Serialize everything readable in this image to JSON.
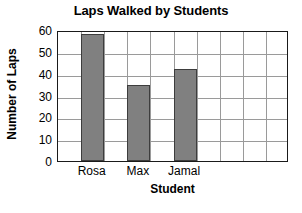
{
  "chart_data": {
    "type": "bar",
    "title": "Laps Walked by Students",
    "xlabel": "Student",
    "ylabel": "Number of Laps",
    "categories": [
      "Rosa",
      "Max",
      "Jamal"
    ],
    "values": [
      58,
      35,
      42
    ],
    "ylim": [
      0,
      60
    ],
    "yticks": [
      0,
      10,
      20,
      30,
      40,
      50,
      60
    ],
    "ytick_labels": [
      "0",
      "10",
      "20",
      "30",
      "40",
      "50",
      "60"
    ],
    "grid": true,
    "grid_columns": 10,
    "legend": null,
    "bar_color": "#808080",
    "bar_edge_color": "#3d3d3d",
    "grid_color": "#9a9a9a",
    "axis_color": "#1a1a1a",
    "background": "#ffffff"
  }
}
